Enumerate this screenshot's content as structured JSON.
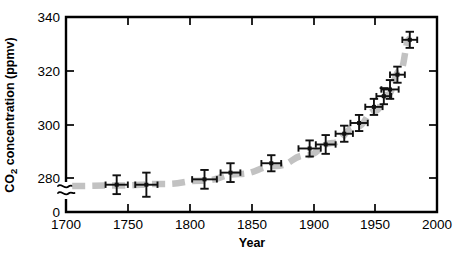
{
  "chart_data": {
    "type": "scatter",
    "title": "",
    "xlabel": "Year",
    "ylabel": "CO2 concentration (ppmv)",
    "ylabel_display": "CO₂ concentration (ppmv)",
    "xlim": [
      1700,
      2000
    ],
    "ylim": [
      270,
      340
    ],
    "axis_break": true,
    "axis_break_symbol": "≈",
    "y_zero_label": "0",
    "grid": false,
    "legend": null,
    "xticks": [
      1700,
      1750,
      1800,
      1850,
      1900,
      1950,
      2000
    ],
    "xticklabels": [
      "1700",
      "1750",
      "1800",
      "1850",
      "1900",
      "1950",
      "2000"
    ],
    "yticks": [
      280,
      300,
      320,
      340
    ],
    "yticklabels": [
      "280",
      "300",
      "320",
      "340"
    ],
    "marker_color": "#111111",
    "trendline_color": "#c2c2c2",
    "trendline_style": "dashed",
    "series": [
      {
        "name": "Ice-core CO2 measurements",
        "points": [
          {
            "x": 1741,
            "y": 277.5,
            "xerr": 9,
            "yerr": 3.5
          },
          {
            "x": 1765,
            "y": 277.5,
            "xerr": 9,
            "yerr": 4.5
          },
          {
            "x": 1812,
            "y": 279.5,
            "xerr": 10,
            "yerr": 3.5
          },
          {
            "x": 1833,
            "y": 282.0,
            "xerr": 8,
            "yerr": 3.5
          },
          {
            "x": 1866,
            "y": 285.5,
            "xerr": 8,
            "yerr": 3.0
          },
          {
            "x": 1897,
            "y": 291.0,
            "xerr": 9,
            "yerr": 3.0
          },
          {
            "x": 1910,
            "y": 292.5,
            "xerr": 8,
            "yerr": 3.5
          },
          {
            "x": 1925,
            "y": 296.5,
            "xerr": 7,
            "yerr": 3.0
          },
          {
            "x": 1937,
            "y": 300.5,
            "xerr": 7,
            "yerr": 3.0
          },
          {
            "x": 1949,
            "y": 306.5,
            "xerr": 7,
            "yerr": 3.0
          },
          {
            "x": 1957,
            "y": 310.5,
            "xerr": 6,
            "yerr": 3.0
          },
          {
            "x": 1962,
            "y": 313.0,
            "xerr": 7,
            "yerr": 3.5
          },
          {
            "x": 1968,
            "y": 318.5,
            "xerr": 6,
            "yerr": 3.0
          },
          {
            "x": 1978,
            "y": 331.5,
            "xerr": 6,
            "yerr": 3.0
          }
        ]
      }
    ],
    "trendline": [
      {
        "x": 1705,
        "y": 277.0
      },
      {
        "x": 1740,
        "y": 277.2
      },
      {
        "x": 1780,
        "y": 277.8
      },
      {
        "x": 1810,
        "y": 279.0
      },
      {
        "x": 1840,
        "y": 281.5
      },
      {
        "x": 1870,
        "y": 284.5
      },
      {
        "x": 1895,
        "y": 288.5
      },
      {
        "x": 1915,
        "y": 293.0
      },
      {
        "x": 1935,
        "y": 299.0
      },
      {
        "x": 1950,
        "y": 305.0
      },
      {
        "x": 1960,
        "y": 311.0
      },
      {
        "x": 1970,
        "y": 320.0
      },
      {
        "x": 1978,
        "y": 332.0
      }
    ]
  }
}
